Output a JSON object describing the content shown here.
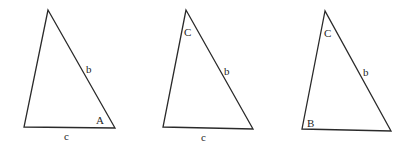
{
  "diagram": {
    "title": "",
    "triangles": [
      {
        "id": "t1",
        "vertices": [
          [
            48,
            10
          ],
          [
            24,
            127
          ],
          [
            115,
            128
          ]
        ],
        "labels": {
          "side_b": {
            "text": "b",
            "x": 86,
            "y": 73
          },
          "angle_A": {
            "text": "A",
            "x": 96,
            "y": 124
          },
          "side_c": {
            "text": "c",
            "x": 64,
            "y": 140
          }
        }
      },
      {
        "id": "t2",
        "vertices": [
          [
            186,
            10
          ],
          [
            163,
            127
          ],
          [
            253,
            129
          ]
        ],
        "labels": {
          "angle_C": {
            "text": "C",
            "x": 184,
            "y": 36
          },
          "side_b": {
            "text": "b",
            "x": 224,
            "y": 75
          },
          "side_c": {
            "text": "c",
            "x": 201,
            "y": 141
          }
        }
      },
      {
        "id": "t3",
        "vertices": [
          [
            325,
            11
          ],
          [
            302,
            129
          ],
          [
            391,
            131
          ]
        ],
        "labels": {
          "angle_C": {
            "text": "C",
            "x": 324,
            "y": 37
          },
          "side_b": {
            "text": "b",
            "x": 363,
            "y": 76
          },
          "angle_B": {
            "text": "B",
            "x": 307,
            "y": 127
          }
        }
      }
    ]
  }
}
